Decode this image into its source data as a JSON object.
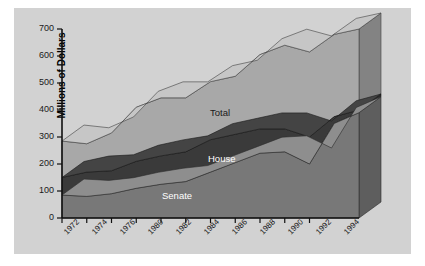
{
  "chart_data": {
    "type": "area",
    "title": "",
    "subtitle": "",
    "xlabel": "",
    "ylabel": "Millions of Dollars",
    "ylim": [
      0,
      700
    ],
    "ytick_values": [
      0,
      100,
      200,
      300,
      400,
      500,
      600,
      700
    ],
    "ytick_labels": [
      "0",
      "100",
      "200",
      "300",
      "400",
      "500",
      "600",
      "700"
    ],
    "grid": false,
    "legend_position": "inline-annotations",
    "three_d": true,
    "x": [
      1972,
      1974,
      1976,
      1978,
      1980,
      1982,
      1984,
      1986,
      1988,
      1990,
      1992,
      1994,
      1995
    ],
    "xtick_labels": [
      "1972",
      "1974",
      "1976",
      "1980",
      "1982",
      "1984",
      "1986",
      "1988",
      "1990",
      "1992",
      "1994"
    ],
    "series": [
      {
        "name": "Senate",
        "color": "#787878",
        "values": [
          85,
          80,
          90,
          110,
          125,
          135,
          170,
          205,
          240,
          245,
          200,
          350,
          390
        ]
      },
      {
        "name": "House",
        "color": "#3a3a3a",
        "values": [
          65,
          90,
          85,
          100,
          105,
          110,
          120,
          105,
          90,
          85,
          100,
          25,
          10
        ]
      },
      {
        "name": "Total",
        "color": "#a8a8a8",
        "values": [
          135,
          105,
          140,
          200,
          215,
          200,
          215,
          215,
          275,
          310,
          315,
          305,
          300
        ]
      }
    ],
    "stacked_totals": [
      285,
      275,
      315,
      410,
      445,
      445,
      505,
      525,
      605,
      640,
      615,
      680,
      700
    ],
    "annotations": [
      {
        "text": "Total",
        "x_approx": 1984,
        "y_approx": 400,
        "color": "#1a1a1a"
      },
      {
        "text": "House",
        "x_approx": 1984,
        "y_approx": 255,
        "color": "#ffffff"
      },
      {
        "text": "Senate",
        "x_approx": 1983,
        "y_approx": 120,
        "color": "#ffffff"
      }
    ],
    "colors": {
      "senate": "#787878",
      "house": "#3a3a3a",
      "total": "#a8a8a8",
      "panel_background": "#d2d2d2",
      "page_background": "#ffffff",
      "axis": "#1a1a1a",
      "depth_wall": "#9a9a9a"
    }
  }
}
